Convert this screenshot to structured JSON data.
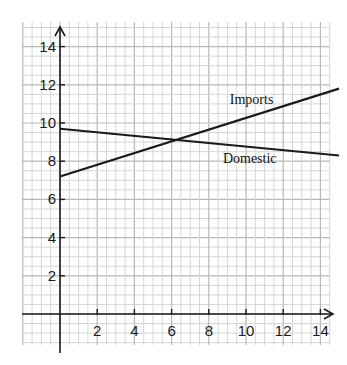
{
  "chart_data": {
    "type": "line",
    "title": "",
    "xlabel": "",
    "ylabel": "",
    "xlim": [
      0,
      15
    ],
    "ylim": [
      0,
      14.8
    ],
    "grid": true,
    "minor_grid": true,
    "legend": "inline labels",
    "x_ticks": [
      2,
      4,
      6,
      8,
      10,
      12,
      14
    ],
    "y_ticks": [
      2,
      4,
      6,
      8,
      10,
      12,
      14
    ],
    "series": [
      {
        "name": "Imports",
        "x": [
          0,
          15
        ],
        "values": [
          7.2,
          11.8
        ]
      },
      {
        "name": "Domestic",
        "x": [
          0,
          15
        ],
        "values": [
          9.7,
          8.3
        ]
      }
    ],
    "annotations": [
      {
        "text": "Imports",
        "x": 10.3,
        "y": 11.0
      },
      {
        "text": "Domestic",
        "x": 10.2,
        "y": 7.9
      }
    ]
  },
  "colors": {
    "line": "#1a1a1a",
    "major_grid": "#b8b8b8",
    "minor_grid": "#d6d6d6",
    "axis": "#1a1a1a"
  }
}
